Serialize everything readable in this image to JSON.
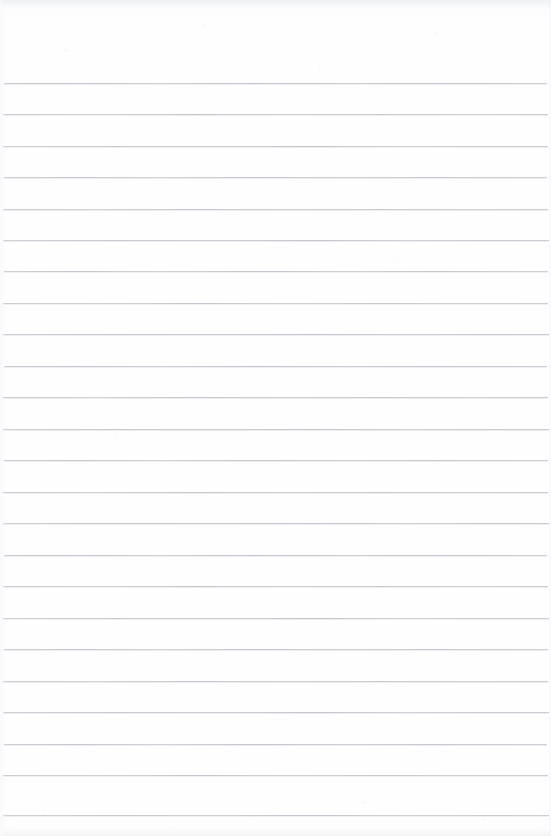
{
  "document": {
    "kind": "scanned-lined-notebook-page",
    "title": "Blank Lined Paper",
    "page_text": "",
    "written_content": "",
    "width_px": 551,
    "height_px": 836,
    "orientation": "portrait",
    "background_color": "#fefeff",
    "rule_color": "#c3c8cd",
    "rule_thickness_px": 1,
    "rule_spacing_px": 31.3,
    "first_rule_y_px": 83,
    "rule_count": 24,
    "rule_left_px": 3,
    "rule_right_px": 548,
    "has_margin_line": false,
    "has_header": false,
    "has_handwriting": false,
    "edge_artifact_color": "#eceef1",
    "rules": [
      {
        "index": 1,
        "y": 83,
        "left": 4,
        "right": 547,
        "variant": "v1"
      },
      {
        "index": 2,
        "y": 114,
        "left": 3,
        "right": 548,
        "variant": "v2"
      },
      {
        "index": 3,
        "y": 146,
        "left": 3,
        "right": 548,
        "variant": "v3"
      },
      {
        "index": 4,
        "y": 177,
        "left": 4,
        "right": 547,
        "variant": "v1"
      },
      {
        "index": 5,
        "y": 209,
        "left": 3,
        "right": 548,
        "variant": "v2"
      },
      {
        "index": 6,
        "y": 240,
        "left": 3,
        "right": 549,
        "variant": "v3"
      },
      {
        "index": 7,
        "y": 271,
        "left": 4,
        "right": 548,
        "variant": "v1"
      },
      {
        "index": 8,
        "y": 303,
        "left": 3,
        "right": 548,
        "variant": "v2"
      },
      {
        "index": 9,
        "y": 334,
        "left": 3,
        "right": 549,
        "variant": "v3"
      },
      {
        "index": 10,
        "y": 366,
        "left": 4,
        "right": 547,
        "variant": "v1"
      },
      {
        "index": 11,
        "y": 397,
        "left": 3,
        "right": 548,
        "variant": "v2"
      },
      {
        "index": 12,
        "y": 429,
        "left": 3,
        "right": 549,
        "variant": "v3"
      },
      {
        "index": 13,
        "y": 460,
        "left": 4,
        "right": 548,
        "variant": "v1"
      },
      {
        "index": 14,
        "y": 492,
        "left": 3,
        "right": 548,
        "variant": "v2"
      },
      {
        "index": 15,
        "y": 523,
        "left": 3,
        "right": 549,
        "variant": "v3"
      },
      {
        "index": 16,
        "y": 555,
        "left": 4,
        "right": 547,
        "variant": "v1"
      },
      {
        "index": 17,
        "y": 586,
        "left": 3,
        "right": 548,
        "variant": "v2"
      },
      {
        "index": 18,
        "y": 618,
        "left": 3,
        "right": 549,
        "variant": "v3"
      },
      {
        "index": 19,
        "y": 649,
        "left": 4,
        "right": 548,
        "variant": "v1"
      },
      {
        "index": 20,
        "y": 681,
        "left": 3,
        "right": 548,
        "variant": "v2"
      },
      {
        "index": 21,
        "y": 712,
        "left": 3,
        "right": 549,
        "variant": "v3"
      },
      {
        "index": 22,
        "y": 744,
        "left": 4,
        "right": 547,
        "variant": "v1"
      },
      {
        "index": 23,
        "y": 775,
        "left": 3,
        "right": 548,
        "variant": "v2"
      },
      {
        "index": 24,
        "y": 815,
        "left": 3,
        "right": 549,
        "variant": "v3"
      }
    ]
  }
}
